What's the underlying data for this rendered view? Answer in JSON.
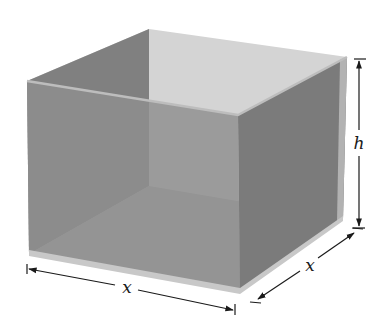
{
  "diagram": {
    "labels": {
      "width": "x",
      "depth": "x",
      "height": "h"
    },
    "colors": {
      "background": "#ffffff",
      "back_wall": "#d4d4d4",
      "left_inner_wall": "#808080",
      "front_face": "#8f8f8f",
      "right_face": "#7b7b7b",
      "floor": "#a9a9a9",
      "rim": "#c6c6c6",
      "dimension_line": "#1a1a1a"
    },
    "shape": {
      "type": "box",
      "open_top": true,
      "base": "square"
    }
  }
}
